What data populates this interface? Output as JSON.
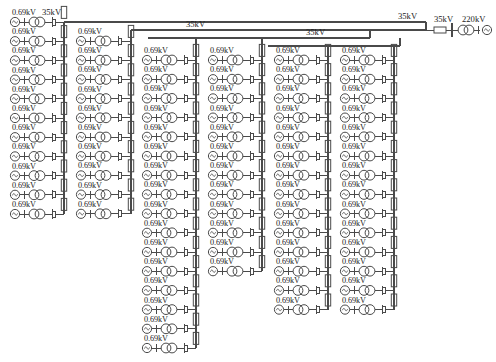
{
  "diagram": {
    "kind": "wind-farm collector single line diagram",
    "colors": {
      "line": "#4a4a4a",
      "text": "#222222",
      "background": "#ffffff"
    },
    "voltage_levels": {
      "generator": "0.69kV",
      "collector": "35kV",
      "transmission": "220kV"
    },
    "labels": {
      "low_voltage": "0.69kV",
      "medium_voltage": "35kV",
      "high_voltage": "220kV"
    },
    "top_left_labels": [
      "0.69kV",
      "35kV"
    ],
    "substation": {
      "breaker_label": "35kV",
      "incoming_label": "220kV",
      "bus_label": "35kV"
    },
    "main_bus": {
      "label": "35kV",
      "x1": 168,
      "x2": 426,
      "y": 22
    },
    "sub_buses": [
      {
        "label": "35kV",
        "x1": 168,
        "x2": 426,
        "y": 30
      },
      {
        "label": "35kV",
        "x1": 148,
        "x2": 370,
        "y": 38,
        "label_x": 186,
        "label_y": 27
      },
      {
        "label": "35kV",
        "x1": 268,
        "x2": 400,
        "y": 46,
        "label_x": 306,
        "label_y": 35
      }
    ],
    "columns": [
      {
        "id": "col-1",
        "name": "feeder-column-1",
        "x": 10,
        "bus_x": 64,
        "top_y": 22,
        "rows": 11,
        "first_row_y": 22,
        "label": "0.69kV"
      },
      {
        "id": "col-2",
        "name": "feeder-column-2",
        "x": 76,
        "bus_x": 131,
        "top_y": 30,
        "rows": 10,
        "first_row_y": 41,
        "label": "0.69kV"
      },
      {
        "id": "col-3",
        "name": "feeder-column-3",
        "x": 142,
        "bus_x": 196,
        "top_y": 38,
        "rows": 16,
        "first_row_y": 60,
        "label": "0.69kV"
      },
      {
        "id": "col-4",
        "name": "feeder-column-4",
        "x": 208,
        "bus_x": 262,
        "top_y": 38,
        "rows": 12,
        "first_row_y": 60,
        "label": "0.69kV"
      },
      {
        "id": "col-5",
        "name": "feeder-column-5",
        "x": 274,
        "bus_x": 328,
        "top_y": 46,
        "rows": 14,
        "first_row_y": 60,
        "label": "0.69kV"
      },
      {
        "id": "col-6",
        "name": "feeder-column-6",
        "x": 340,
        "bus_x": 394,
        "top_y": 46,
        "rows": 14,
        "first_row_y": 60,
        "label": "0.69kV"
      }
    ],
    "row_pitch": 19.2,
    "feeder_symbols": [
      "generator-circle",
      "transformer-two-circle",
      "circuit-breaker",
      "reactor-rectangle"
    ],
    "counts": {
      "total_feeders": 77,
      "columns": 6
    }
  }
}
